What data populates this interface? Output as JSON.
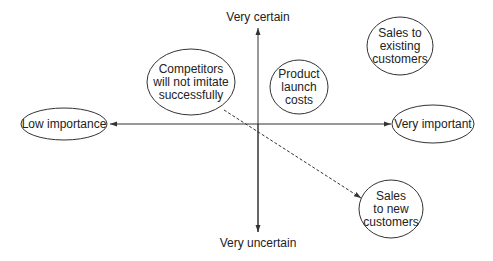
{
  "axes": {
    "top_label": "Very certain",
    "bottom_label": "Very uncertain",
    "left_label": "Low importance",
    "right_label": "Very important"
  },
  "nodes": [
    {
      "id": "competitors",
      "label": "Competitors\nwill not imitate\nsuccessfully"
    },
    {
      "id": "launch",
      "label": "Product\nlaunch\ncosts"
    },
    {
      "id": "existing",
      "label": "Sales to\nexisting\ncustomers"
    },
    {
      "id": "new",
      "label": "Sales\nto new\ncustomers"
    }
  ],
  "connections": [
    {
      "from": "competitors",
      "to": "new",
      "style": "dashed",
      "arrow": "end"
    }
  ],
  "colors": {
    "stroke": "#333333",
    "text": "#222222",
    "background": "#ffffff"
  }
}
